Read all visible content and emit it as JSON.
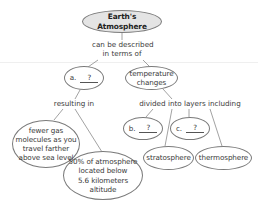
{
  "diagram": {
    "type": "concept-map",
    "root": {
      "label": "Earth's Atmosphere"
    },
    "link_root": {
      "label_line1": "can be described",
      "label_line2": "in terms of"
    },
    "node_a": {
      "letter": "a.",
      "answer": "?"
    },
    "node_temperature": {
      "line1": "temperature",
      "line2": "changes"
    },
    "link_resulting": {
      "label": "resulting in"
    },
    "link_divided": {
      "label": "divided into layers including"
    },
    "node_fewer": {
      "line1": "fewer gas",
      "line2": "molecules as you",
      "line3": "travel farther",
      "line4": "above sea level"
    },
    "node_fifty": {
      "line1": "50% of atmosphere",
      "line2": "located below",
      "line3": "5.6 kilometers",
      "line4": "altitude"
    },
    "node_b": {
      "letter": "b.",
      "answer": "?"
    },
    "node_c": {
      "letter": "c.",
      "answer": "?"
    },
    "node_stratosphere": {
      "label": "stratosphere"
    },
    "node_thermosphere": {
      "label": "thermosphere"
    },
    "colors": {
      "root_fill": "#e4e4e4",
      "stroke": "#7a7a7a",
      "text": "#3a3a3a"
    }
  }
}
